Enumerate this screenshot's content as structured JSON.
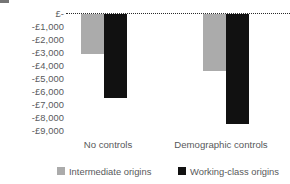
{
  "chart_data": {
    "type": "bar",
    "title": "",
    "subtitle": "",
    "xlabel": "",
    "ylabel": "",
    "categories": [
      "No controls",
      "Demographic controls"
    ],
    "series": [
      {
        "name": "Intermediate origins",
        "color": "#ababab",
        "values": [
          -3050,
          -4350
        ]
      },
      {
        "name": "Working-class origins",
        "color": "#111111",
        "values": [
          -6400,
          -8400
        ]
      }
    ],
    "ylim": [
      -9500,
      0
    ],
    "yticks": [
      0,
      -1000,
      -2000,
      -3000,
      -4000,
      -5000,
      -6000,
      -7000,
      -8000,
      -9000
    ],
    "ytick_labels": [
      "£-",
      "-£1,000",
      "-£2,000",
      "-£3,000",
      "-£4,000",
      "-£5,000",
      "-£6,000",
      "-£7,000",
      "-£8,000",
      "-£9,000"
    ],
    "grid": "zero-line-only-dotted",
    "legend_position": "bottom",
    "currency": "GBP",
    "orientation": "vertical-downward"
  },
  "legend": {
    "items": [
      {
        "label": "Intermediate origins",
        "swatch": "light-gray-square-icon"
      },
      {
        "label": "Working-class origins",
        "swatch": "black-square-icon"
      }
    ]
  }
}
